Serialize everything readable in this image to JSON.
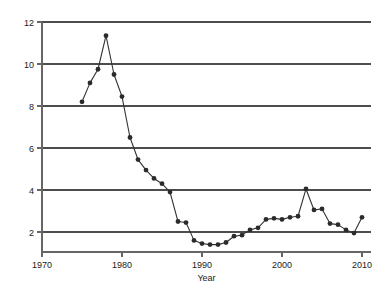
{
  "chart_data": {
    "type": "line",
    "title": "",
    "subtitle": "",
    "xlabel": "Year",
    "ylabel": "",
    "xlim": [
      1968.5,
      2011.5
    ],
    "ylim": [
      1.3,
      12.3
    ],
    "xticks": [
      1970,
      1980,
      1990,
      2000,
      2010
    ],
    "xtick_labels": [
      "1970",
      "1980",
      "1990",
      "2000",
      "2010"
    ],
    "yticks": [
      2,
      4,
      6,
      8,
      10,
      12
    ],
    "ytick_labels": [
      "2",
      "4",
      "6",
      "8",
      "10",
      "12"
    ],
    "gridlines": "horizontal",
    "legend": "none",
    "marker": "filled-circle",
    "line_color": "#333333",
    "marker_color": "#2b2b2b",
    "grid_color": "#4d4d4d",
    "axis_color": "#666666",
    "x": [
      1975,
      1976,
      1977,
      1978,
      1979,
      1980,
      1981,
      1982,
      1983,
      1984,
      1985,
      1986,
      1987,
      1988,
      1989,
      1990,
      1991,
      1992,
      1993,
      1994,
      1995,
      1996,
      1997,
      1998,
      1999,
      2000,
      2001,
      2002,
      2003,
      2004,
      2005,
      2006,
      2007,
      2008,
      2009,
      2010
    ],
    "values": [
      8.2,
      9.1,
      9.75,
      11.35,
      9.5,
      8.45,
      6.5,
      5.45,
      4.95,
      4.55,
      4.3,
      3.9,
      2.5,
      2.45,
      1.6,
      1.45,
      1.4,
      1.4,
      1.5,
      1.8,
      1.85,
      2.1,
      2.2,
      2.6,
      2.65,
      2.6,
      2.7,
      2.75,
      4.05,
      3.05,
      3.1,
      2.4,
      2.35,
      2.1,
      1.95,
      2.7
    ],
    "series": [
      {
        "name": "series-1",
        "x": [
          1975,
          1976,
          1977,
          1978,
          1979,
          1980,
          1981,
          1982,
          1983,
          1984,
          1985,
          1986,
          1987,
          1988,
          1989,
          1990,
          1991,
          1992,
          1993,
          1994,
          1995,
          1996,
          1997,
          1998,
          1999,
          2000,
          2001,
          2002,
          2003,
          2004,
          2005,
          2006,
          2007,
          2008,
          2009,
          2010
        ],
        "values": [
          8.2,
          9.1,
          9.75,
          11.35,
          9.5,
          8.45,
          6.5,
          5.45,
          4.95,
          4.55,
          4.3,
          3.9,
          2.5,
          2.45,
          1.6,
          1.45,
          1.4,
          1.4,
          1.5,
          1.8,
          1.85,
          2.1,
          2.2,
          2.6,
          2.65,
          2.6,
          2.7,
          2.75,
          4.05,
          3.05,
          3.1,
          2.4,
          2.35,
          2.1,
          1.95,
          2.7
        ]
      }
    ]
  }
}
